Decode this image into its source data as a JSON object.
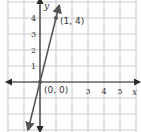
{
  "chart_data": {
    "type": "line",
    "title": "",
    "xlabel": "x",
    "ylabel": "y",
    "xlim": [
      -2,
      6
    ],
    "ylim": [
      -3,
      5
    ],
    "grid": true,
    "x_tick_labels": [
      {
        "value": 3,
        "label": "3"
      },
      {
        "value": 4,
        "label": "4"
      },
      {
        "value": 5,
        "label": "5"
      }
    ],
    "y_tick_labels": [
      {
        "value": 1,
        "label": "1"
      },
      {
        "value": 2,
        "label": "2"
      },
      {
        "value": 3,
        "label": "3"
      },
      {
        "value": 4,
        "label": "4"
      }
    ],
    "series": [
      {
        "name": "y = 4x",
        "slope": 4,
        "intercept": 0,
        "x_range": [
          -0.75,
          1.2
        ]
      }
    ],
    "points": [
      {
        "x": 0,
        "y": 0,
        "label": "(0, 0)"
      },
      {
        "x": 1,
        "y": 4,
        "label": "(1, 4)"
      }
    ],
    "colors": {
      "grid": "#c8c8c8",
      "axis": "#2a2a2a",
      "line": "#555555"
    }
  }
}
